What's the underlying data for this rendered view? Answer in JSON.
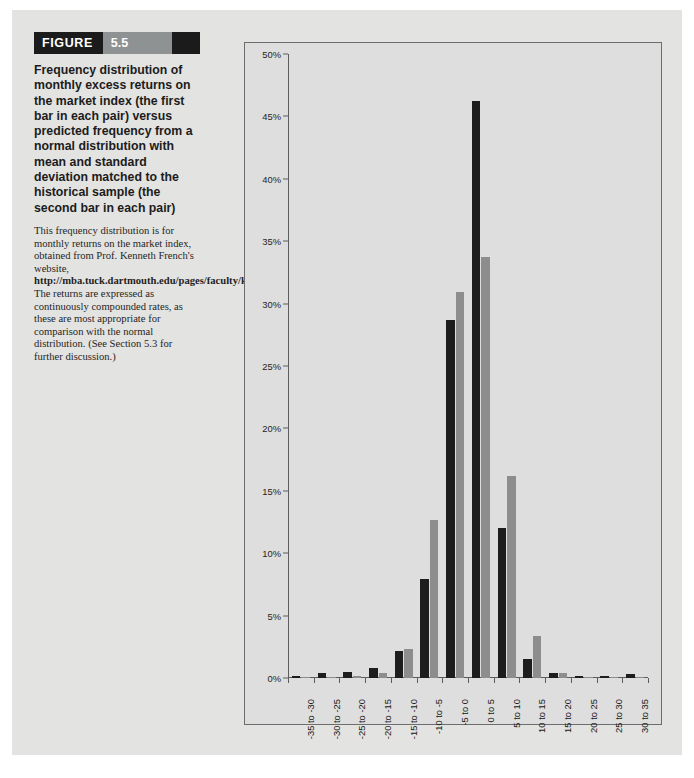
{
  "figure": {
    "banner_label": "FIGURE",
    "number": "5.5",
    "title": "Frequency distribution of monthly excess returns on the market index (the first bar in each pair) versus predicted frequency from a normal distribution with mean and standard deviation matched to the historical sample (the second bar in each pair)",
    "note_part1": "This frequency distribution is for monthly returns on the market index, obtained from Prof. Kenneth French's website, ",
    "note_link": "http://mba.tuck.dartmouth.edu/pages/faculty/ken.french/data_library.html.",
    "note_part2": " The returns are expressed as continuously compounded rates, as these are most appropriate for comparison with the normal distribution. (See Section 5.3 for further discussion.)"
  },
  "colors": {
    "historical_bar": "#1d1d1d",
    "normal_bar": "#8d8d8d",
    "panel_background": "#dedede",
    "page_background": "#e3e3e1",
    "axis": "#5c5c5c"
  },
  "chart_data": {
    "type": "bar",
    "title": "",
    "xlabel": "",
    "ylabel": "",
    "ylim": [
      0,
      50
    ],
    "ytick_labels": [
      "50%",
      "45%",
      "40%",
      "35%",
      "30%",
      "25%",
      "20%",
      "15%",
      "10%",
      "5%",
      "0%"
    ],
    "ytick_values": [
      50,
      45,
      40,
      35,
      30,
      25,
      20,
      15,
      10,
      5,
      0
    ],
    "grid": false,
    "legend_position": "none",
    "categories": [
      "-35 to -30",
      "-30 to -25",
      "-25 to -20",
      "-20 to -15",
      "-15 to -10",
      "-10 to -5",
      "-5 to 0",
      "0 to 5",
      "5 to 10",
      "10 to 15",
      "15 to 20",
      "20 to 25",
      "25 to 30",
      "30 to 35"
    ],
    "series": [
      {
        "name": "Historical frequency (first bar in each pair)",
        "color": "#1d1d1d",
        "values": [
          0.2,
          0.4,
          0.5,
          0.8,
          2.2,
          7.9,
          28.7,
          46.2,
          12.0,
          1.5,
          0.4,
          0.2,
          0.2,
          0.3
        ]
      },
      {
        "name": "Normal distribution predicted frequency (second bar in each pair)",
        "color": "#8d8d8d",
        "values": [
          0.1,
          0.1,
          0.2,
          0.4,
          2.3,
          12.7,
          30.9,
          33.7,
          16.2,
          3.4,
          0.4,
          0.1,
          0.1,
          0.1
        ]
      }
    ]
  }
}
